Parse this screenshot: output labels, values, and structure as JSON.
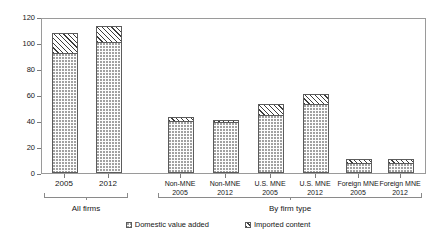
{
  "chart_data": {
    "type": "bar",
    "title": "",
    "subtitle": "",
    "xlabel": "",
    "ylabel": "",
    "ylim": [
      0,
      120
    ],
    "ytick_labels": [
      "0",
      "20",
      "40",
      "60",
      "80",
      "100",
      "120"
    ],
    "ytick_values": [
      0,
      20,
      40,
      60,
      80,
      100,
      120
    ],
    "grid": false,
    "stacked": true,
    "legend_position": "bottom-center",
    "categories": [
      "2005",
      "2012",
      "Non-MNE 2005",
      "Non-MNE 2012",
      "U.S. MNE 2005",
      "U.S. MNE 2012",
      "Foreign MNE 2005",
      "Foreign MNE 2012"
    ],
    "series": [
      {
        "name": "Domestic value added",
        "values": [
          92,
          101,
          40,
          39,
          45,
          53,
          8,
          8
        ]
      },
      {
        "name": "Imported content",
        "values": [
          16,
          12,
          3,
          2,
          8,
          8,
          3,
          3
        ]
      }
    ],
    "totals": [
      108,
      113,
      43,
      41,
      53,
      61,
      11,
      11
    ]
  },
  "axis": {
    "y_ticks": [
      {
        "label": "120",
        "value": 120
      },
      {
        "label": "100",
        "value": 100
      },
      {
        "label": "80",
        "value": 80
      },
      {
        "label": "60",
        "value": 60
      },
      {
        "label": "40",
        "value": 40
      },
      {
        "label": "20",
        "value": 20
      },
      {
        "label": "0",
        "value": 0
      }
    ]
  },
  "bars": [
    {
      "name": "all-firms-2005",
      "line1": "2005",
      "line2": "",
      "domestic": 92,
      "imported": 16,
      "total": 108
    },
    {
      "name": "all-firms-2012",
      "line1": "2012",
      "line2": "",
      "domestic": 101,
      "imported": 12,
      "total": 113
    },
    {
      "name": "non-mne-2005",
      "line1": "Non-MNE",
      "line2": "2005",
      "domestic": 40,
      "imported": 3,
      "total": 43
    },
    {
      "name": "non-mne-2012",
      "line1": "Non-MNE",
      "line2": "2012",
      "domestic": 39,
      "imported": 2,
      "total": 41
    },
    {
      "name": "us-mne-2005",
      "line1": "U.S. MNE",
      "line2": "2005",
      "domestic": 45,
      "imported": 8,
      "total": 53
    },
    {
      "name": "us-mne-2012",
      "line1": "U.S. MNE",
      "line2": "2012",
      "domestic": 53,
      "imported": 8,
      "total": 61
    },
    {
      "name": "foreign-mne-2005",
      "line1": "Foreign MNE",
      "line2": "2005",
      "domestic": 8,
      "imported": 3,
      "total": 11
    },
    {
      "name": "foreign-mne-2012",
      "line1": "Foreign MNE",
      "line2": "2012",
      "domestic": 8,
      "imported": 3,
      "total": 11
    }
  ],
  "groups": [
    {
      "name": "all-firms",
      "label": "All firms"
    },
    {
      "name": "by-firm-type",
      "label": "By firm type"
    }
  ],
  "legend": {
    "items": [
      {
        "name": "domestic-value-added",
        "label": "Domestic value added",
        "pattern": "dotted"
      },
      {
        "name": "imported-content",
        "label": "Imported content",
        "pattern": "hatched"
      }
    ]
  },
  "colors": {
    "axis": "#9a9a9a",
    "bar_outline": "#5c5c5c",
    "domestic_fill": "#fdfdfd",
    "domestic_dot": "#9e9e9e",
    "imported_hatch": "#3d3d3d",
    "background": "#ffffff",
    "text": "#161616"
  }
}
